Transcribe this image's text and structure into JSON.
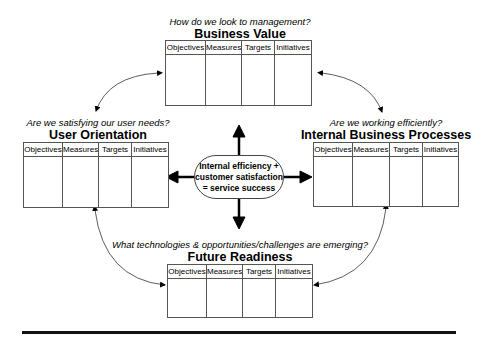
{
  "center": {
    "lines": [
      "Internal efficiency +",
      "customer satisfaction",
      "= service success"
    ]
  },
  "columns": [
    "Objectives",
    "Measures",
    "Targets",
    "Initiatives"
  ],
  "perspectives": {
    "business_value": {
      "question": "How do we look to management?",
      "title": "Business Value"
    },
    "user_orientation": {
      "question": "Are we satisfying our user needs?",
      "title": "User Orientation"
    },
    "internal_processes": {
      "question": "Are we working efficiently?",
      "title": "Internal Business Processes"
    },
    "future_readiness": {
      "question": "What technologies & opportunities/challenges are emerging?",
      "title": "Future Readiness"
    }
  },
  "colors": {
    "line": "#555555",
    "arrow": "#000000",
    "rule": "#111111"
  }
}
